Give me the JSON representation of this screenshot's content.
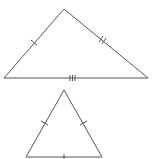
{
  "diagram": {
    "stroke_color": "#555555",
    "background": "#ffffff",
    "triangles": [
      {
        "name": "scalene-triangle",
        "vertices": [
          [
            64,
            9
          ],
          [
            4,
            78
          ],
          [
            148,
            78
          ]
        ],
        "ticks": {
          "left_side": 1,
          "right_side": 2,
          "base": 3
        }
      },
      {
        "name": "equilateral-triangle",
        "vertices": [
          [
            64,
            90
          ],
          [
            26,
            157
          ],
          [
            102,
            157
          ]
        ],
        "ticks": {
          "left_side": 1,
          "right_side": 1,
          "base": 1
        }
      }
    ]
  }
}
